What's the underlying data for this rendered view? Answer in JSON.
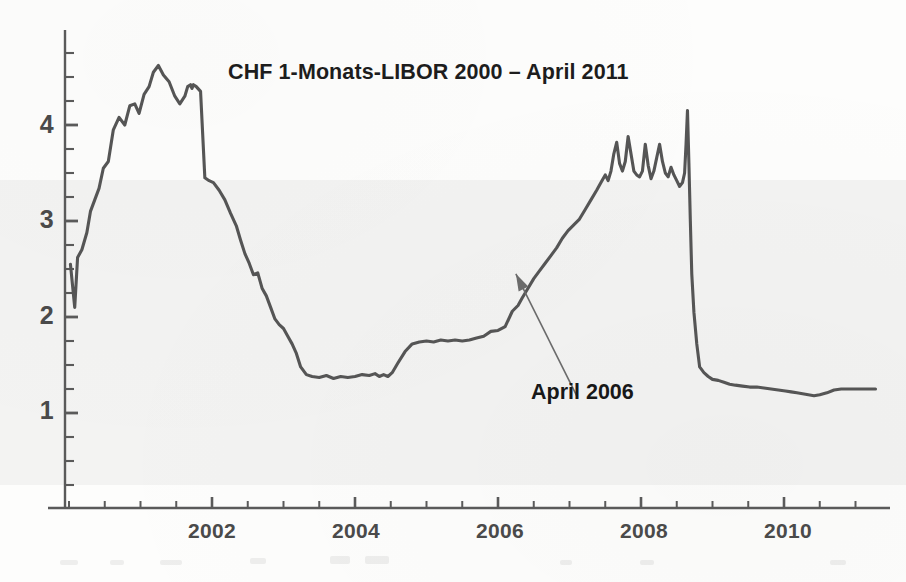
{
  "chart_data": {
    "type": "line",
    "title": "CHF 1-Monats-LIBOR   2000 – April 2011",
    "xlabel": "",
    "ylabel": "",
    "xlim": [
      2000.0,
      2011.3
    ],
    "ylim": [
      0,
      4.85
    ],
    "grid": false,
    "legend": null,
    "x_ticks": [
      2002,
      2004,
      2006,
      2008,
      2010
    ],
    "x_tick_labels": [
      "2002",
      "2004",
      "2006",
      "2008",
      "2010"
    ],
    "x_minor_tick_step": 0.5,
    "y_ticks": [
      1,
      2,
      3,
      4
    ],
    "y_tick_labels": [
      "1",
      "2",
      "3",
      "4"
    ],
    "y_minor_tick_step": 0.25,
    "line_color": "#555555",
    "series": [
      {
        "name": "CHF 1-Monats-LIBOR",
        "unit": "percent",
        "x": [
          2000.02,
          2000.08,
          2000.12,
          2000.18,
          2000.25,
          2000.3,
          2000.36,
          2000.42,
          2000.48,
          2000.55,
          2000.62,
          2000.7,
          2000.78,
          2000.85,
          2000.92,
          2000.98,
          2001.05,
          2001.12,
          2001.18,
          2001.25,
          2001.32,
          2001.4,
          2001.48,
          2001.55,
          2001.62,
          2001.66,
          2001.7,
          2001.72,
          2001.74,
          2001.78,
          2001.84,
          2001.9,
          2001.96,
          2002.02,
          2002.1,
          2002.18,
          2002.26,
          2002.34,
          2002.4,
          2002.46,
          2002.52,
          2002.58,
          2002.64,
          2002.7,
          2002.76,
          2002.82,
          2002.88,
          2002.94,
          2003.0,
          2003.06,
          2003.12,
          2003.18,
          2003.24,
          2003.32,
          2003.4,
          2003.5,
          2003.6,
          2003.7,
          2003.8,
          2003.9,
          2004.0,
          2004.1,
          2004.2,
          2004.28,
          2004.34,
          2004.4,
          2004.46,
          2004.52,
          2004.6,
          2004.7,
          2004.8,
          2004.9,
          2005.0,
          2005.1,
          2005.2,
          2005.3,
          2005.4,
          2005.5,
          2005.6,
          2005.7,
          2005.8,
          2005.9,
          2006.0,
          2006.1,
          2006.2,
          2006.28,
          2006.34,
          2006.42,
          2006.5,
          2006.58,
          2006.66,
          2006.74,
          2006.82,
          2006.9,
          2006.98,
          2007.06,
          2007.14,
          2007.22,
          2007.3,
          2007.38,
          2007.44,
          2007.5,
          2007.54,
          2007.58,
          2007.62,
          2007.66,
          2007.7,
          2007.74,
          2007.78,
          2007.82,
          2007.86,
          2007.9,
          2007.94,
          2007.98,
          2008.02,
          2008.06,
          2008.1,
          2008.14,
          2008.18,
          2008.22,
          2008.26,
          2008.3,
          2008.34,
          2008.38,
          2008.42,
          2008.46,
          2008.5,
          2008.54,
          2008.58,
          2008.61,
          2008.63,
          2008.65,
          2008.67,
          2008.69,
          2008.71,
          2008.74,
          2008.78,
          2008.82,
          2008.88,
          2008.94,
          2009.0,
          2009.08,
          2009.16,
          2009.24,
          2009.32,
          2009.42,
          2009.52,
          2009.62,
          2009.72,
          2009.82,
          2009.92,
          2010.02,
          2010.1,
          2010.18,
          2010.26,
          2010.34,
          2010.42,
          2010.5,
          2010.6,
          2010.7,
          2010.8,
          2010.9,
          2011.0,
          2011.1,
          2011.2,
          2011.28
        ],
        "y": [
          2.55,
          2.1,
          2.62,
          2.7,
          2.88,
          3.1,
          3.22,
          3.34,
          3.55,
          3.62,
          3.95,
          4.08,
          4.0,
          4.2,
          4.22,
          4.12,
          4.32,
          4.4,
          4.55,
          4.62,
          4.52,
          4.45,
          4.3,
          4.22,
          4.3,
          4.4,
          4.42,
          4.38,
          4.42,
          4.4,
          4.35,
          3.45,
          3.42,
          3.4,
          3.32,
          3.22,
          3.08,
          2.95,
          2.8,
          2.66,
          2.56,
          2.44,
          2.46,
          2.3,
          2.22,
          2.1,
          1.98,
          1.92,
          1.88,
          1.8,
          1.72,
          1.62,
          1.48,
          1.4,
          1.38,
          1.37,
          1.39,
          1.36,
          1.38,
          1.37,
          1.38,
          1.4,
          1.39,
          1.41,
          1.38,
          1.4,
          1.38,
          1.42,
          1.52,
          1.64,
          1.72,
          1.74,
          1.75,
          1.74,
          1.76,
          1.75,
          1.76,
          1.75,
          1.76,
          1.78,
          1.8,
          1.85,
          1.86,
          1.9,
          2.06,
          2.12,
          2.2,
          2.3,
          2.4,
          2.48,
          2.56,
          2.64,
          2.72,
          2.82,
          2.9,
          2.96,
          3.02,
          3.12,
          3.22,
          3.32,
          3.4,
          3.48,
          3.42,
          3.52,
          3.7,
          3.82,
          3.6,
          3.52,
          3.62,
          3.88,
          3.7,
          3.52,
          3.48,
          3.46,
          3.52,
          3.8,
          3.58,
          3.44,
          3.52,
          3.66,
          3.8,
          3.62,
          3.5,
          3.46,
          3.56,
          3.48,
          3.42,
          3.36,
          3.4,
          3.5,
          3.8,
          4.15,
          3.6,
          3.0,
          2.45,
          2.05,
          1.72,
          1.48,
          1.42,
          1.38,
          1.35,
          1.34,
          1.32,
          1.3,
          1.29,
          1.28,
          1.27,
          1.27,
          1.26,
          1.25,
          1.24,
          1.23,
          1.22,
          1.21,
          1.2,
          1.19,
          1.18,
          1.19,
          1.21,
          1.24,
          1.25,
          1.25,
          1.25,
          1.25,
          1.25,
          1.25
        ]
      }
    ],
    "annotations": [
      {
        "text": "April 2006",
        "points_to_x": 2006.25,
        "points_to_y": 2.45,
        "label_x": 2007.1,
        "label_y": 1.18
      }
    ]
  },
  "axis": {
    "y_labels": [
      "4",
      "3",
      "2",
      "1"
    ],
    "x_labels": [
      "2002",
      "2004",
      "2006",
      "2008",
      "2010"
    ]
  }
}
